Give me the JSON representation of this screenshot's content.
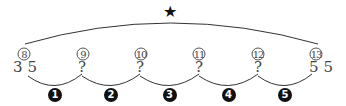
{
  "top_marker": {
    "icon": "star-icon",
    "glyph": "★"
  },
  "positions": [
    {
      "index_label": "8",
      "value": "3 5"
    },
    {
      "index_label": "9",
      "value": "?"
    },
    {
      "index_label": "10",
      "value": "?"
    },
    {
      "index_label": "11",
      "value": "?"
    },
    {
      "index_label": "12",
      "value": "?"
    },
    {
      "index_label": "13",
      "value": "5 5"
    }
  ],
  "steps": [
    "1",
    "2",
    "3",
    "4",
    "5"
  ]
}
